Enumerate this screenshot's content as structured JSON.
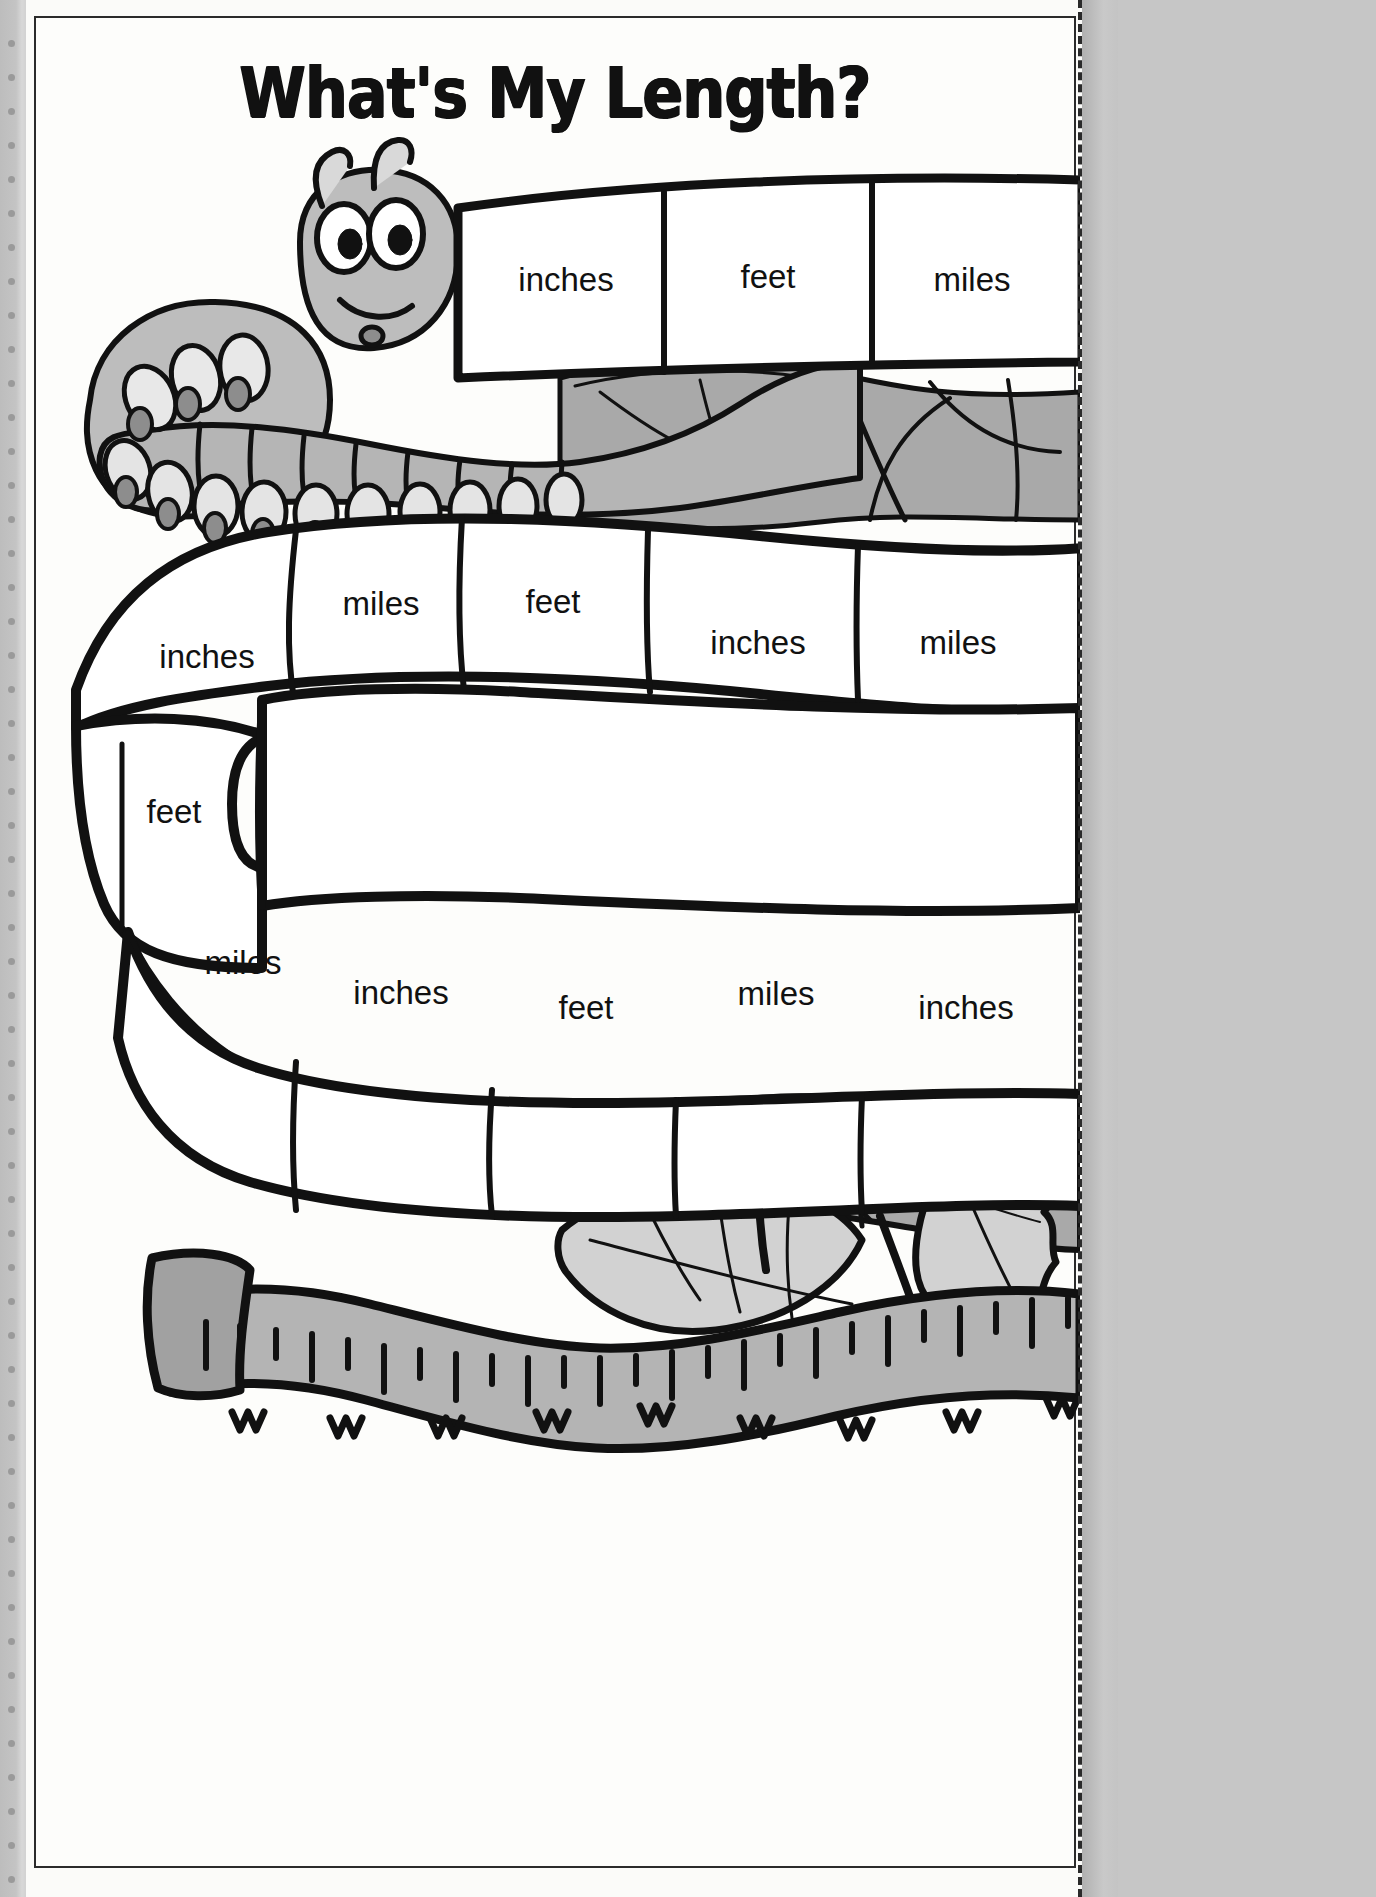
{
  "worksheet": {
    "title": "What's My Length?",
    "theme": "measurement units",
    "paper_color": "#fdfdfb",
    "ink_color": "#111111",
    "art_gray_mid": "#a9a9a9",
    "art_gray_light": "#d2d2d2",
    "art_gray_dark": "#8a8a8a"
  },
  "rows": [
    {
      "name": "top-band",
      "cells": [
        {
          "label": "inches"
        },
        {
          "label": "feet"
        },
        {
          "label": "miles"
        }
      ]
    },
    {
      "name": "upper-worm-band",
      "cells": [
        {
          "label": "inches"
        },
        {
          "label": "miles"
        },
        {
          "label": "feet"
        },
        {
          "label": "inches"
        },
        {
          "label": "miles"
        }
      ]
    },
    {
      "name": "middle-worm-band",
      "cells": [
        {
          "label": "feet"
        }
      ]
    },
    {
      "name": "lower-worm-band",
      "cells": [
        {
          "label": "miles"
        },
        {
          "label": "inches"
        },
        {
          "label": "feet"
        },
        {
          "label": "miles"
        },
        {
          "label": "inches"
        }
      ]
    }
  ],
  "artwork": {
    "caterpillar": "cartoon-caterpillar",
    "leaves": "mulberry-leaves",
    "tape_measure": "tape-measure-ruler"
  },
  "cut_guide": {
    "style": "dashed-vertical-line"
  }
}
